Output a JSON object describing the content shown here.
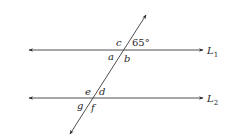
{
  "diagram": {
    "colors": {
      "line": "#3a3a3a",
      "text": "#2a2a2a",
      "background": "#ffffff"
    },
    "lines": [
      {
        "id": "L1",
        "label": "L",
        "subscript": "1",
        "y": 50,
        "x1": 29,
        "x2": 203
      },
      {
        "id": "L2",
        "label": "L",
        "subscript": "2",
        "y": 98,
        "x1": 29,
        "x2": 203
      }
    ],
    "transversal": {
      "x1": 70,
      "y1": 134,
      "x2": 146,
      "y2": 15
    },
    "angle_labels": {
      "c": "c",
      "given": "65°",
      "a": "a",
      "b": "b",
      "e": "e",
      "d": "d",
      "g": "g",
      "f": "f"
    }
  }
}
